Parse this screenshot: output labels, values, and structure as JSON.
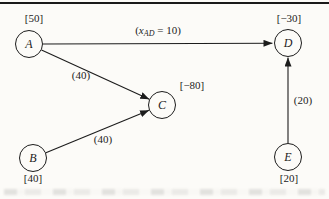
{
  "diagram": {
    "colors": {
      "ink": "#1c1c1c",
      "paper": "#fcfbf8",
      "rule": "#1a1a1a"
    },
    "nodes": [
      {
        "id": "A",
        "label": "A",
        "supply": "[50]"
      },
      {
        "id": "B",
        "label": "B",
        "supply": "[40]"
      },
      {
        "id": "C",
        "label": "C",
        "supply": "[−80]"
      },
      {
        "id": "D",
        "label": "D",
        "supply": "[−30]"
      },
      {
        "id": "E",
        "label": "E",
        "supply": "[20]"
      }
    ],
    "edges": [
      {
        "from": "A",
        "to": "D",
        "label_open": "(",
        "label_var": "x",
        "label_sub": "AD",
        "label_rest": " = 10)"
      },
      {
        "from": "A",
        "to": "C",
        "label": "(40)"
      },
      {
        "from": "B",
        "to": "C",
        "label": "(40)"
      },
      {
        "from": "E",
        "to": "D",
        "label": "(20)"
      }
    ]
  }
}
